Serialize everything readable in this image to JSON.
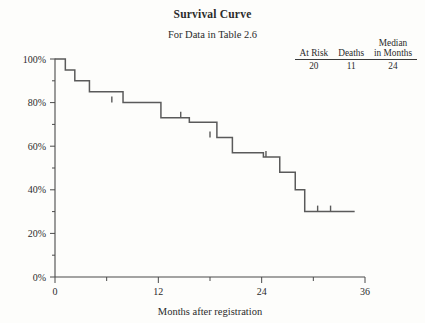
{
  "figure": {
    "title": "Survival Curve",
    "subtitle": "For Data in Table 2.6"
  },
  "risk_table": {
    "headers": [
      "At Risk",
      "Deaths",
      "Median in Months"
    ],
    "header_parts": {
      "median_top": "Median",
      "median_bottom": "in Months"
    },
    "values": [
      "20",
      "11",
      "24"
    ]
  },
  "chart_data": {
    "type": "line",
    "subtype": "kaplan-meier-step",
    "title": "Survival Curve",
    "subtitle": "For Data in Table 2.6",
    "xlabel": "Months after registration",
    "ylabel": "",
    "xlim": [
      0,
      36
    ],
    "ylim": [
      0,
      100
    ],
    "grid": false,
    "legend": "none",
    "x_ticks": [
      0,
      12,
      24,
      36
    ],
    "x_tick_labels": [
      "0",
      "12",
      "24",
      "36"
    ],
    "x_minor_ticks": [
      6,
      18,
      30
    ],
    "y_ticks": [
      0,
      20,
      40,
      60,
      80,
      100
    ],
    "y_tick_labels": [
      "0%",
      "20%",
      "40%",
      "60%",
      "80%",
      "100%"
    ],
    "y_minor_ticks": [
      10,
      30,
      50,
      70,
      90
    ],
    "at_risk": 20,
    "deaths": 11,
    "median_months": 24,
    "step_points": [
      {
        "x": 0.0,
        "y": 100
      },
      {
        "x": 1.2,
        "y": 95
      },
      {
        "x": 2.3,
        "y": 90
      },
      {
        "x": 4.0,
        "y": 85
      },
      {
        "x": 7.9,
        "y": 80
      },
      {
        "x": 12.3,
        "y": 73
      },
      {
        "x": 15.6,
        "y": 71
      },
      {
        "x": 18.8,
        "y": 64
      },
      {
        "x": 20.6,
        "y": 57
      },
      {
        "x": 24.2,
        "y": 55
      },
      {
        "x": 26.1,
        "y": 48
      },
      {
        "x": 27.9,
        "y": 40
      },
      {
        "x": 29.0,
        "y": 30
      },
      {
        "x": 34.8,
        "y": 30
      }
    ],
    "censored_marks": [
      {
        "x": 6.6,
        "y": 80
      },
      {
        "x": 14.6,
        "y": 73
      },
      {
        "x": 18.0,
        "y": 64
      },
      {
        "x": 24.5,
        "y": 55
      },
      {
        "x": 30.5,
        "y": 30
      },
      {
        "x": 32.0,
        "y": 30
      }
    ]
  },
  "axes": {
    "x_label": "Months after registration"
  },
  "colors": {
    "curve": "#5a5a5a",
    "axis": "#4a4a4a",
    "text": "#2b2b2b",
    "background": "#fdfdfb"
  }
}
